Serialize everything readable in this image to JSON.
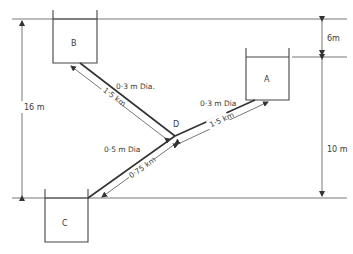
{
  "diagram": {
    "reservoirs": [
      {
        "id": "A",
        "label": "A"
      },
      {
        "id": "B",
        "label": "B"
      },
      {
        "id": "C",
        "label": "C"
      }
    ],
    "junction": {
      "label": "D"
    },
    "pipes": [
      {
        "from": "B",
        "to": "D",
        "diameter": "0·3 m Dia.",
        "length": "1·5 km"
      },
      {
        "from": "A",
        "to": "D",
        "diameter": "0·3 m Dia",
        "length": "1·5 km"
      },
      {
        "from": "D",
        "to": "C",
        "diameter": "0·5 m Dia",
        "length": "0·75 km"
      }
    ],
    "dimensions": {
      "b_to_c_height": "16 m",
      "b_to_a_height": "6m",
      "a_to_c_height": "10 m"
    }
  }
}
